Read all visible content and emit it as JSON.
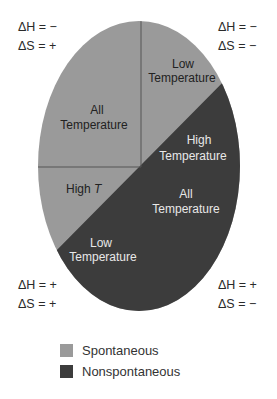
{
  "colors": {
    "spontaneous": "#9a9a9a",
    "nonspontaneous": "#3c3c3c",
    "divider": "#555555",
    "text_on_light": "#222222",
    "text_on_dark": "#e8e8e8"
  },
  "corners": {
    "top_left": {
      "dH": "ΔH = −",
      "dS": "ΔS = +"
    },
    "top_right": {
      "dH": "ΔH = −",
      "dS": "ΔS = −"
    },
    "bottom_left": {
      "dH": "ΔH = +",
      "dS": "ΔS = +"
    },
    "bottom_right": {
      "dH": "ΔH = +",
      "dS": "ΔS = −"
    }
  },
  "regions": {
    "upper_left": {
      "line1": "All",
      "line2": "Temperature",
      "state": "Spontaneous"
    },
    "upper_right": {
      "line1": "Low",
      "line2": "Temperature",
      "state": "Spontaneous"
    },
    "right_dark": {
      "line1": "High",
      "line2": "Temperature",
      "state": "Nonspontaneous"
    },
    "lower_right": {
      "line1": "All",
      "line2": "Temperature",
      "state": "Nonspontaneous"
    },
    "left_light": {
      "line1": "High ",
      "line1_italic": "T",
      "state": "Spontaneous"
    },
    "lower_left": {
      "line1": "Low",
      "line2": "Temperature",
      "state": "Nonspontaneous"
    }
  },
  "legend": [
    {
      "label": "Spontaneous",
      "color": "#9a9a9a"
    },
    {
      "label": "Nonspontaneous",
      "color": "#3c3c3c"
    }
  ]
}
